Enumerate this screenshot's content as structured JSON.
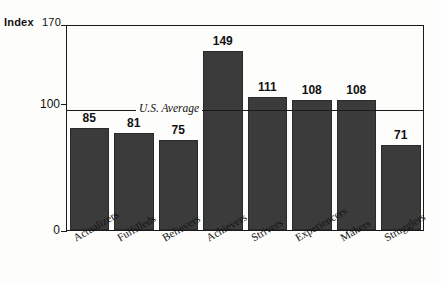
{
  "chart_data": {
    "type": "bar",
    "title": "",
    "subtitle": "",
    "xlabel": "",
    "ylabel": "Index",
    "ylim": [
      0,
      170
    ],
    "yticks": [
      "0",
      "100",
      "170"
    ],
    "grid": false,
    "legend": "none",
    "categories": [
      "Actualizers",
      "Fulfilleds",
      "Believers",
      "Achievers",
      "Strivers",
      "Experiencers",
      "Makers",
      "Strugglers"
    ],
    "values": [
      85,
      81,
      75,
      149,
      111,
      108,
      108,
      71
    ],
    "value_labels": [
      "85",
      "81",
      "75",
      "149",
      "111",
      "108",
      "108",
      "71"
    ],
    "annotations": [
      {
        "name": "us-average-line",
        "label": "U.S. Average",
        "y_value": 100,
        "style": "horizontal reference line with inline italic label"
      }
    ],
    "colors": {
      "bar_fill": "#3b3b3b",
      "bar_edge": "#2a2a2a",
      "axis": "#1a1a1a",
      "text": "#111111",
      "background": "#fdfdfb"
    }
  },
  "axis": {
    "index_caption": "Index",
    "tick_170": "170",
    "tick_100": "100",
    "tick_0": "0"
  },
  "annotation": {
    "us_average": "U.S. Average"
  }
}
